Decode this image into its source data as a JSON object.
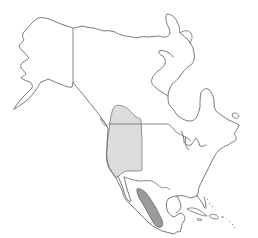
{
  "map": {
    "region": "North America",
    "type": "species range map",
    "ranges": [
      {
        "name": "western-north-america-range",
        "fill": "#dcdcdc",
        "area": "Western United States and southern British Columbia"
      },
      {
        "name": "western-mexico-range",
        "fill": "#9a9a9a",
        "area": "Western Mexico (Sierra Madre Occidental / Pacific slope)"
      }
    ],
    "colors": {
      "background": "#ffffff",
      "outline": "#6a6a6a",
      "range_light": "#dcdcdc",
      "range_dark": "#9a9a9a"
    }
  }
}
